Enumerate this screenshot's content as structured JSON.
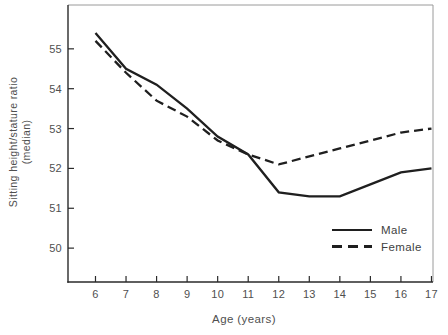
{
  "colors": {
    "line": "#1f1f1f",
    "axis": "#2a2a2a",
    "box_border": "#9a9a9a",
    "text": "#4f4f4f",
    "background": "#ffffff"
  },
  "chart_data": {
    "type": "line",
    "title": "",
    "xlabel": "Age (years)",
    "ylabel_line1": "Sitting height/stature ratio",
    "ylabel_line2": "(median)",
    "x": [
      6,
      7,
      8,
      9,
      10,
      11,
      12,
      13,
      14,
      15,
      16,
      17
    ],
    "series": [
      {
        "name": "Male",
        "style": "solid",
        "values": [
          55.4,
          54.5,
          54.1,
          53.5,
          52.8,
          52.35,
          51.4,
          51.3,
          51.3,
          51.6,
          51.9,
          52.0
        ]
      },
      {
        "name": "Female",
        "style": "dashed",
        "values": [
          55.2,
          54.4,
          53.7,
          53.3,
          52.7,
          52.35,
          52.1,
          52.3,
          52.5,
          52.7,
          52.9,
          53.0
        ]
      }
    ],
    "y_ticks": [
      50,
      51,
      52,
      53,
      54,
      55
    ],
    "x_ticks": [
      6,
      7,
      8,
      9,
      10,
      11,
      12,
      13,
      14,
      15,
      16,
      17
    ],
    "ylim": [
      49.15,
      56.1
    ],
    "xlim": [
      5.1,
      17.05
    ],
    "grid": false,
    "legend_position": "lower right"
  },
  "legend": {
    "items": [
      {
        "label": "Male",
        "style": "solid"
      },
      {
        "label": "Female",
        "style": "dashed"
      }
    ]
  }
}
